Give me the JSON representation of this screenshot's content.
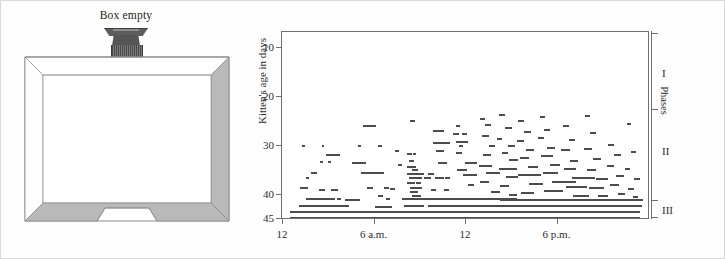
{
  "figure": {
    "box_panel": {
      "caption": "Box empty",
      "fixture_name": "ceiling-light-fixture"
    }
  },
  "chart_data": {
    "type": "scatter",
    "title": "",
    "subtitle": "",
    "xlabel": "",
    "ylabel": "Kitten's age in days",
    "right_axis_label": "Phases",
    "grid": false,
    "legend": "none",
    "xlim": [
      0,
      24
    ],
    "ylim": [
      45,
      7
    ],
    "y_axis_inverted": true,
    "xticks": [
      0,
      6,
      12,
      18
    ],
    "xticklabels": [
      "12",
      "6 a.m.",
      "12",
      "6 p.m."
    ],
    "yticks": [
      10,
      20,
      30,
      40,
      45
    ],
    "yticklabels": [
      "10",
      "20",
      "30",
      "40",
      "45"
    ],
    "phases": [
      {
        "label": "I",
        "y_center": 15.5,
        "y_start": 7.5,
        "y_end": 23.0
      },
      {
        "label": "II",
        "y_center": 31.5,
        "y_start": 23.0,
        "y_end": 41.5
      },
      {
        "label": "III",
        "y_center": 43.5,
        "y_start": 41.5,
        "y_end": 45.0
      }
    ],
    "phase_tick_positions": [
      7.5,
      23.0,
      41.5,
      45.0
    ],
    "note": "Raster plot of kitten activity episodes. Each horizontal mark is an activity bout: x = clock time (hours from midnight), y = age in days, width = bout duration in hours.",
    "series": [
      {
        "name": "activity-bouts",
        "color": "#4c4c4c",
        "marks": [
          [
            1.3,
            30.0,
            0.18
          ],
          [
            2.6,
            30.0,
            0.18
          ],
          [
            1.9,
            35.7,
            0.22
          ],
          [
            2.1,
            35.7,
            0.22
          ],
          [
            1.6,
            36.6,
            0.2
          ],
          [
            1.2,
            38.6,
            0.5
          ],
          [
            2.5,
            33.3,
            0.2
          ],
          [
            3.0,
            33.3,
            0.2
          ],
          [
            2.4,
            39.0,
            0.4
          ],
          [
            3.2,
            39.0,
            0.45
          ],
          [
            1.6,
            41.0,
            1.4
          ],
          [
            2.6,
            41.0,
            0.9
          ],
          [
            3.6,
            41.0,
            0.3
          ],
          [
            1.1,
            42.4,
            3.3
          ],
          [
            1.0,
            43.6,
            9.0
          ],
          [
            1.0,
            44.8,
            9.6
          ],
          [
            2.9,
            32.0,
            0.9
          ],
          [
            3.3,
            32.0,
            0.3
          ],
          [
            4.1,
            41.2,
            1.0
          ],
          [
            5.3,
            26.0,
            0.6
          ],
          [
            5.9,
            26.0,
            0.25
          ],
          [
            5.2,
            35.7,
            0.9
          ],
          [
            4.6,
            33.6,
            0.9
          ],
          [
            5.0,
            30.0,
            0.2
          ],
          [
            6.3,
            30.0,
            0.25
          ],
          [
            6.0,
            35.7,
            0.7
          ],
          [
            6.7,
            38.6,
            0.3
          ],
          [
            5.6,
            38.6,
            0.35
          ],
          [
            6.8,
            41.0,
            0.25
          ],
          [
            6.3,
            40.2,
            0.3
          ],
          [
            7.4,
            31.2,
            0.25
          ],
          [
            7.6,
            34.0,
            0.3
          ],
          [
            7.1,
            38.8,
            0.3
          ],
          [
            7.9,
            41.0,
            2.3
          ],
          [
            6.1,
            42.5,
            1.1
          ],
          [
            8.0,
            42.3,
            0.6
          ],
          [
            8.4,
            24.9,
            0.3
          ],
          [
            8.2,
            31.8,
            0.3
          ],
          [
            8.6,
            31.8,
            0.2
          ],
          [
            8.3,
            33.2,
            0.35
          ],
          [
            8.2,
            34.3,
            0.6
          ],
          [
            8.5,
            35.0,
            0.4
          ],
          [
            8.2,
            35.8,
            0.9
          ],
          [
            8.9,
            35.8,
            0.4
          ],
          [
            8.3,
            36.6,
            0.9
          ],
          [
            9.3,
            36.6,
            0.5
          ],
          [
            8.2,
            37.6,
            0.5
          ],
          [
            8.8,
            37.6,
            0.3
          ],
          [
            8.4,
            38.6,
            0.8
          ],
          [
            8.4,
            39.4,
            0.5
          ],
          [
            8.5,
            40.2,
            0.6
          ],
          [
            8.3,
            41.0,
            0.9
          ],
          [
            9.1,
            41.0,
            0.3
          ],
          [
            8.6,
            42.3,
            0.7
          ],
          [
            9.6,
            42.3,
            0.4
          ],
          [
            9.9,
            27.0,
            0.6
          ],
          [
            10.3,
            27.0,
            0.3
          ],
          [
            9.9,
            29.5,
            0.6
          ],
          [
            10.5,
            29.5,
            0.5
          ],
          [
            10.1,
            31.2,
            0.5
          ],
          [
            10.2,
            33.5,
            0.6
          ],
          [
            9.6,
            35.8,
            0.35
          ],
          [
            10.0,
            36.6,
            0.6
          ],
          [
            10.7,
            36.6,
            0.3
          ],
          [
            9.8,
            39.0,
            0.3
          ],
          [
            10.6,
            39.0,
            0.35
          ],
          [
            9.7,
            41.0,
            1.0
          ],
          [
            10.5,
            41.0,
            1.3
          ],
          [
            9.8,
            42.3,
            3.1
          ],
          [
            11.4,
            26.0,
            0.3
          ],
          [
            11.2,
            27.6,
            0.4
          ],
          [
            11.8,
            27.6,
            0.3
          ],
          [
            11.4,
            29.3,
            0.8
          ],
          [
            11.6,
            30.1,
            0.3
          ],
          [
            11.4,
            31.5,
            0.4
          ],
          [
            12.0,
            33.5,
            0.8
          ],
          [
            11.5,
            35.0,
            0.6
          ],
          [
            11.9,
            36.0,
            0.9
          ],
          [
            12.2,
            38.0,
            0.4
          ],
          [
            11.7,
            41.0,
            1.2
          ],
          [
            12.4,
            41.0,
            1.4
          ],
          [
            12.1,
            42.3,
            2.6
          ],
          [
            13.0,
            24.6,
            0.3
          ],
          [
            13.3,
            25.8,
            0.4
          ],
          [
            13.1,
            28.0,
            0.5
          ],
          [
            13.6,
            30.0,
            0.4
          ],
          [
            13.2,
            32.0,
            0.5
          ],
          [
            12.9,
            34.2,
            0.9
          ],
          [
            13.4,
            35.7,
            0.9
          ],
          [
            13.0,
            37.5,
            0.6
          ],
          [
            13.7,
            39.5,
            0.6
          ],
          [
            13.2,
            41.0,
            2.2
          ],
          [
            13.6,
            42.3,
            1.9
          ],
          [
            14.2,
            23.8,
            0.4
          ],
          [
            14.6,
            26.4,
            0.5
          ],
          [
            14.1,
            28.7,
            0.35
          ],
          [
            14.8,
            30.0,
            0.5
          ],
          [
            14.4,
            31.6,
            0.4
          ],
          [
            14.9,
            33.0,
            0.6
          ],
          [
            14.2,
            34.8,
            1.2
          ],
          [
            14.7,
            36.4,
            0.8
          ],
          [
            14.3,
            38.2,
            0.6
          ],
          [
            14.9,
            40.0,
            0.5
          ],
          [
            14.3,
            41.1,
            2.5
          ],
          [
            14.7,
            42.3,
            2.4
          ],
          [
            15.5,
            25.0,
            0.4
          ],
          [
            15.9,
            27.3,
            0.4
          ],
          [
            15.4,
            29.0,
            0.5
          ],
          [
            16.0,
            31.0,
            0.5
          ],
          [
            15.6,
            32.6,
            0.6
          ],
          [
            16.1,
            34.4,
            0.7
          ],
          [
            15.5,
            36.0,
            1.5
          ],
          [
            16.2,
            37.8,
            0.9
          ],
          [
            15.7,
            39.6,
            0.8
          ],
          [
            16.1,
            41.1,
            2.8
          ],
          [
            15.9,
            42.3,
            3.0
          ],
          [
            16.9,
            24.2,
            0.35
          ],
          [
            17.2,
            26.9,
            0.4
          ],
          [
            16.8,
            28.4,
            0.4
          ],
          [
            17.4,
            30.4,
            0.5
          ],
          [
            17.0,
            32.2,
            0.8
          ],
          [
            17.6,
            34.0,
            0.6
          ],
          [
            17.1,
            35.6,
            1.0
          ],
          [
            17.7,
            37.4,
            1.6
          ],
          [
            17.2,
            39.2,
            1.2
          ],
          [
            17.5,
            41.1,
            3.2
          ],
          [
            17.2,
            42.3,
            2.8
          ],
          [
            18.4,
            26.0,
            0.4
          ],
          [
            18.8,
            28.9,
            0.4
          ],
          [
            18.3,
            31.0,
            0.6
          ],
          [
            18.9,
            33.2,
            0.5
          ],
          [
            18.5,
            34.8,
            0.8
          ],
          [
            19.0,
            36.6,
            1.5
          ],
          [
            18.6,
            38.4,
            1.4
          ],
          [
            19.1,
            40.2,
            1.0
          ],
          [
            18.8,
            41.1,
            3.0
          ],
          [
            18.5,
            42.3,
            3.4
          ],
          [
            19.9,
            23.9,
            0.3
          ],
          [
            20.2,
            27.5,
            0.4
          ],
          [
            19.8,
            30.8,
            0.5
          ],
          [
            20.4,
            32.8,
            0.5
          ],
          [
            20.0,
            35.0,
            0.6
          ],
          [
            20.6,
            36.8,
            0.8
          ],
          [
            20.1,
            38.6,
            1.0
          ],
          [
            20.7,
            40.4,
            0.7
          ],
          [
            20.2,
            41.1,
            2.6
          ],
          [
            20.0,
            42.3,
            3.6
          ],
          [
            21.4,
            29.8,
            0.4
          ],
          [
            21.8,
            32.0,
            0.4
          ],
          [
            21.3,
            34.2,
            0.5
          ],
          [
            21.9,
            36.2,
            0.5
          ],
          [
            21.5,
            38.0,
            0.6
          ],
          [
            22.0,
            39.8,
            0.5
          ],
          [
            21.6,
            41.1,
            2.0
          ],
          [
            21.4,
            42.3,
            2.2
          ],
          [
            22.6,
            25.5,
            0.3
          ],
          [
            22.9,
            31.4,
            0.3
          ],
          [
            22.5,
            34.8,
            0.35
          ],
          [
            23.1,
            36.8,
            0.4
          ],
          [
            22.7,
            38.8,
            0.4
          ],
          [
            23.0,
            40.6,
            0.35
          ],
          [
            22.8,
            41.1,
            0.9
          ],
          [
            22.6,
            42.3,
            1.0
          ],
          [
            0.5,
            43.6,
            23.0
          ],
          [
            0.5,
            44.8,
            23.0
          ]
        ]
      }
    ]
  }
}
